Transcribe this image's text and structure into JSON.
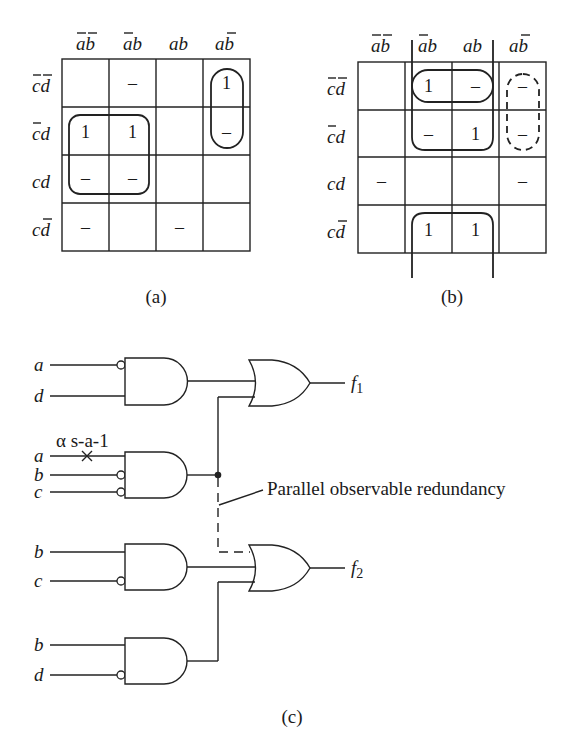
{
  "kmap_a": {
    "caption": "(a)",
    "col_headers": [
      {
        "var1": "a",
        "bar1": true,
        "var2": "b",
        "bar2": true
      },
      {
        "var1": "a",
        "bar1": true,
        "var2": "b",
        "bar2": false
      },
      {
        "var1": "a",
        "bar1": false,
        "var2": "b",
        "bar2": false
      },
      {
        "var1": "a",
        "bar1": false,
        "var2": "b",
        "bar2": true
      }
    ],
    "row_headers": [
      {
        "var1": "c",
        "bar1": true,
        "var2": "d",
        "bar2": true
      },
      {
        "var1": "c",
        "bar1": true,
        "var2": "d",
        "bar2": false
      },
      {
        "var1": "c",
        "bar1": false,
        "var2": "d",
        "bar2": false
      },
      {
        "var1": "c",
        "bar1": false,
        "var2": "d",
        "bar2": true
      }
    ],
    "cells": [
      [
        "",
        "–",
        "",
        "1"
      ],
      [
        "1",
        "1",
        "",
        "–"
      ],
      [
        "–",
        "–",
        "",
        ""
      ],
      [
        "–",
        "",
        "–",
        ""
      ]
    ]
  },
  "kmap_b": {
    "caption": "(b)",
    "cells": [
      [
        "",
        "1",
        "–",
        "–"
      ],
      [
        "",
        "–",
        "1",
        "–"
      ],
      [
        "–",
        "",
        "",
        "–"
      ],
      [
        "",
        "1",
        "1",
        ""
      ]
    ]
  },
  "circuit": {
    "caption": "(c)",
    "gate1_inputs": [
      "a",
      "d"
    ],
    "gate2_inputs": [
      "a",
      "b",
      "c"
    ],
    "gate3_inputs": [
      "b",
      "c"
    ],
    "gate4_inputs": [
      "b",
      "d"
    ],
    "fault_label": "α s-a-1",
    "output1": "f",
    "output1_sub": "1",
    "output2": "f",
    "output2_sub": "2",
    "annotation": "Parallel observable redundancy"
  }
}
